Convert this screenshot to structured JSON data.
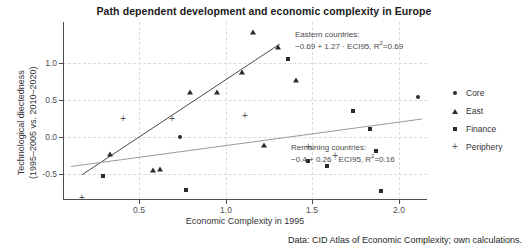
{
  "chart_data": {
    "type": "scatter",
    "title": "Path dependent development and economic complexity in Europe",
    "xlabel": "Economic Complexity in 1995",
    "ylabel_line1": "Technological diectedness",
    "ylabel_line2": "(1995–2005 vs. 2010–2020)",
    "caption": "Data: CID Atlas of Economic Complexity; own calculations.",
    "xlim": [
      0.05,
      2.35
    ],
    "ylim": [
      -0.78,
      1.38
    ],
    "xticks": [
      0.5,
      1.0,
      1.5,
      2.0
    ],
    "xticklabels": [
      "0.5",
      "1.0",
      "1.5",
      "2.0"
    ],
    "yticks": [
      -0.5,
      0.0,
      0.5,
      1.0
    ],
    "yticklabels": [
      "-0.5",
      "0.0",
      "0.5",
      "1.0"
    ],
    "grid": true,
    "legend_position": "right",
    "legend": [
      {
        "label": "Core",
        "marker": "circle"
      },
      {
        "label": "East",
        "marker": "triangle"
      },
      {
        "label": "Finance",
        "marker": "square"
      },
      {
        "label": "Periphery",
        "marker": "plus"
      }
    ],
    "annotations": [
      {
        "name": "eastern-fit",
        "line1": "Eastern countries:",
        "line2_pre": "−0.69 + 1.27 · ECI95, R",
        "line2_sup": "2",
        "line2_post": "=0.69",
        "intercept": -0.69,
        "slope": 1.27,
        "r_squared": 0.69
      },
      {
        "name": "remaining-fit",
        "line1": "Remaining countries:",
        "line2_pre": "−0.4 + 0.26 · ECI95, R",
        "line2_sup": "2",
        "line2_post": "=0.16",
        "intercept": -0.4,
        "slope": 0.26,
        "r_squared": 0.16
      }
    ],
    "fit_lines": [
      {
        "name": "eastern",
        "intercept": -0.69,
        "slope": 1.27,
        "x_start": 0.17,
        "x_end": 1.42,
        "color": "#4a4a4a"
      },
      {
        "name": "remaining",
        "intercept": -0.4,
        "slope": 0.26,
        "x_start": 0.1,
        "x_end": 2.32,
        "color": "#9a9a9a"
      }
    ],
    "series": [
      {
        "name": "East",
        "marker": "triangle",
        "points": [
          [
            0.35,
            -0.22
          ],
          [
            0.62,
            -0.42
          ],
          [
            0.66,
            -0.4
          ],
          [
            0.85,
            0.53
          ],
          [
            1.02,
            0.53
          ],
          [
            1.18,
            0.77
          ],
          [
            1.25,
            1.26
          ],
          [
            1.32,
            -0.11
          ],
          [
            1.41,
            1.08
          ],
          [
            1.52,
            0.68
          ]
        ]
      },
      {
        "name": "Core",
        "marker": "circle",
        "points": [
          [
            0.79,
            -0.01
          ],
          [
            2.29,
            0.47
          ]
        ]
      },
      {
        "name": "Finance",
        "marker": "square",
        "points": [
          [
            0.3,
            -0.49
          ],
          [
            0.83,
            -0.66
          ],
          [
            1.47,
            0.93
          ],
          [
            1.6,
            -0.31
          ],
          [
            1.72,
            -0.37
          ],
          [
            1.88,
            0.3
          ],
          [
            1.99,
            0.08
          ],
          [
            2.03,
            -0.18
          ],
          [
            2.06,
            -0.67
          ]
        ]
      },
      {
        "name": "Periphery",
        "marker": "plus",
        "points": [
          [
            0.17,
            -0.74
          ],
          [
            0.43,
            0.21
          ],
          [
            0.74,
            0.22
          ],
          [
            1.2,
            0.25
          ],
          [
            1.6,
            -0.13
          ],
          [
            1.77,
            -0.23
          ]
        ]
      }
    ]
  }
}
